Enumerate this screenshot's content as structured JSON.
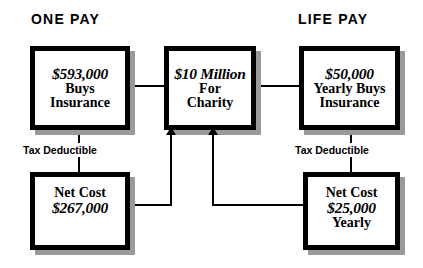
{
  "headers": {
    "left": "ONE PAY",
    "right": "LIFE PAY"
  },
  "boxes": {
    "one_pay_premium": {
      "amount": "$593,000",
      "line2": "Buys",
      "line3": "Insurance"
    },
    "charity": {
      "amount": "$10 Million",
      "line2": "For",
      "line3": "Charity"
    },
    "life_pay_premium": {
      "amount": "$50,000",
      "line2": "Yearly Buys",
      "line3": "Insurance"
    },
    "one_pay_net_cost": {
      "line1": "Net Cost",
      "amount": "$267,000"
    },
    "life_pay_net_cost": {
      "line1": "Net Cost",
      "amount": "$25,000",
      "line3": "Yearly"
    }
  },
  "labels": {
    "tax_deductible_left": "Tax Deductible",
    "tax_deductible_right": "Tax Deductible"
  },
  "colors": {
    "line": "#000000",
    "box_border": "#000000",
    "box_fill": "#ffffff",
    "shadow": "#9a9a9a",
    "background": "#ffffff",
    "text": "#000000"
  }
}
